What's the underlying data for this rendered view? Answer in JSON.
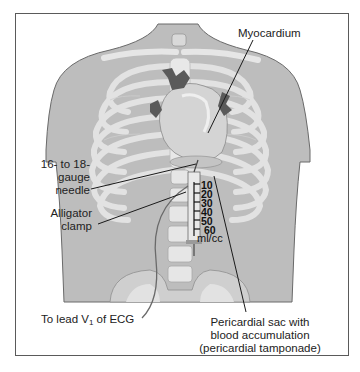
{
  "figure": {
    "type": "medical illustration",
    "palette": {
      "skin": "#bdbdbd",
      "bone": "#e4e4e4",
      "bone_shadow": "#cfcfcf",
      "heart": "#d6d6d6",
      "vessels": "#555555",
      "leader_line": "#1a1a1a",
      "frame": "#5a5a5a"
    }
  },
  "labels": {
    "myocardium": "Myocardium",
    "needle_line1": "16- to 18-",
    "needle_line2": "gauge",
    "needle_line3": "needle",
    "clamp_line1": "Alligator",
    "clamp_line2": "clamp",
    "ecg_prefix": "To lead V",
    "ecg_sub": "1",
    "ecg_suffix": " of ECG",
    "sac_line1": "Pericardial sac with",
    "sac_line2": "blood accumulation",
    "sac_line3": "(pericardial tamponade)"
  },
  "syringe": {
    "scale": [
      "10",
      "20",
      "30",
      "40",
      "50",
      "60"
    ],
    "unit": "ml/cc"
  }
}
